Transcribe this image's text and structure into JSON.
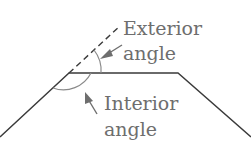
{
  "diagram": {
    "labels": {
      "exterior_line1": "Exterior",
      "exterior_line2": "angle",
      "interior_line1": "Interior",
      "interior_line2": "angle"
    },
    "colors": {
      "shape_line": "#3a3a3a",
      "annotation": "#6e6e6e",
      "background": "#ffffff"
    },
    "shape": {
      "type": "trapezoid-outline",
      "vertices": [
        [
          0,
          137
        ],
        [
          69,
          73
        ],
        [
          178,
          73
        ],
        [
          251,
          137
        ]
      ],
      "extension": {
        "style": "dashed",
        "from": [
          69,
          73
        ],
        "to": [
          120,
          27
        ]
      }
    }
  }
}
